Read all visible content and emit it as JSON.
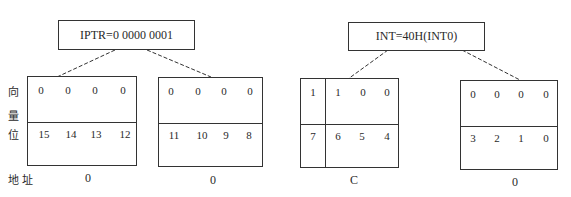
{
  "top_nodes": [
    {
      "label": "IPTR=0 0000 0001"
    },
    {
      "label": "INT=40H(INT0)"
    }
  ],
  "side_labels": {
    "vector_chars": [
      "向",
      "量",
      "位"
    ],
    "address": "地 址"
  },
  "registers": [
    {
      "values": [
        "0",
        "0",
        "0",
        "0"
      ],
      "bits": [
        "15",
        "14",
        "13",
        "12"
      ],
      "address": "0"
    },
    {
      "values": [
        "0",
        "0",
        "0",
        "0"
      ],
      "bits": [
        "11",
        "10",
        "9",
        "8"
      ],
      "address": "0"
    },
    {
      "values": [
        "1",
        "1",
        "0",
        "0"
      ],
      "bits": [
        "7",
        "6",
        "5",
        "4"
      ],
      "address": "C"
    },
    {
      "values": [
        "0",
        "0",
        "0",
        "0"
      ],
      "bits": [
        "3",
        "2",
        "1",
        "0"
      ],
      "address": "0"
    }
  ]
}
